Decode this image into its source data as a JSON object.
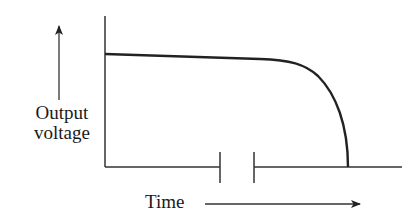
{
  "diagram": {
    "type": "output-voltage-vs-time",
    "y_axis_label_line1": "Output",
    "y_axis_label_line2": "voltage",
    "x_axis_label": "Time",
    "y_arrow_direction": "up",
    "x_arrow_direction": "right",
    "x_axis_has_break": true,
    "curve_description": "Output voltage stays nearly constant, declining slowly, then drops sharply to zero",
    "stroke_color": "#222222",
    "background_color": "#ffffff"
  }
}
